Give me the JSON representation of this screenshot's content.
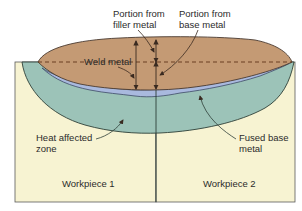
{
  "diagram": {
    "labels": {
      "filler": {
        "line1": "Portion from",
        "line2": "filler metal"
      },
      "base": {
        "line1": "Portion from",
        "line2": "base metal"
      },
      "weld_metal": "Weld metal",
      "haz": {
        "line1": "Heat affected",
        "line2": "zone"
      },
      "fused": {
        "line1": "Fused base",
        "line2": "metal"
      },
      "workpiece1": "Workpiece 1",
      "workpiece2": "Workpiece 2"
    },
    "colors": {
      "workpiece": "#f7f3d2",
      "haz": "#9cc3b8",
      "fused_base": "#a9b9de",
      "weld_metal": "#c49a74",
      "outline": "#3a4a44",
      "dashed_line": "#6b3f22",
      "arrow": "#3a2a20"
    }
  }
}
